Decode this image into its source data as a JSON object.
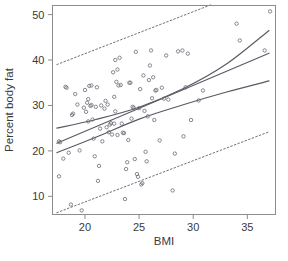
{
  "figure": {
    "background_color": "#ffffff",
    "frame_color": "#8c8c8c",
    "point_color": "#6b6b76",
    "line_color": "#595964",
    "band_color": "#6f6f7a"
  },
  "chart_data": {
    "type": "scatter",
    "title": "",
    "subtitle": "",
    "xlabel": "BMI",
    "ylabel": "Percent body fat",
    "xlim": [
      17.0,
      37.6
    ],
    "ylim": [
      6.0,
      52.0
    ],
    "grid": false,
    "legend_position": "none",
    "xticks": [
      20,
      25,
      30,
      35
    ],
    "xticklabels": [
      "20",
      "25",
      "30",
      "35"
    ],
    "yticks": [
      10,
      20,
      30,
      40,
      50
    ],
    "yticklabels": [
      "10",
      "20",
      "30",
      "40",
      "50"
    ],
    "marker": "open-circle",
    "annotations": [],
    "points": [
      {
        "x": 17.6,
        "y": 14.4
      },
      {
        "x": 17.6,
        "y": 22.1
      },
      {
        "x": 17.7,
        "y": 21.9
      },
      {
        "x": 18.0,
        "y": 18.3
      },
      {
        "x": 18.2,
        "y": 34.1
      },
      {
        "x": 18.3,
        "y": 33.9
      },
      {
        "x": 18.5,
        "y": 19.6
      },
      {
        "x": 18.7,
        "y": 8.2
      },
      {
        "x": 18.8,
        "y": 27.9
      },
      {
        "x": 18.9,
        "y": 28.2
      },
      {
        "x": 19.1,
        "y": 32.5
      },
      {
        "x": 19.3,
        "y": 30.2
      },
      {
        "x": 19.5,
        "y": 20.1
      },
      {
        "x": 19.7,
        "y": 6.9
      },
      {
        "x": 19.9,
        "y": 29.5
      },
      {
        "x": 20.0,
        "y": 33.4
      },
      {
        "x": 20.1,
        "y": 28.6
      },
      {
        "x": 20.2,
        "y": 30.6
      },
      {
        "x": 20.3,
        "y": 31.4
      },
      {
        "x": 20.3,
        "y": 26.5
      },
      {
        "x": 20.4,
        "y": 34.3
      },
      {
        "x": 20.5,
        "y": 29.9
      },
      {
        "x": 20.6,
        "y": 30.1
      },
      {
        "x": 20.6,
        "y": 34.4
      },
      {
        "x": 20.7,
        "y": 26.9
      },
      {
        "x": 20.8,
        "y": 22.7
      },
      {
        "x": 20.9,
        "y": 18.8
      },
      {
        "x": 21.0,
        "y": 29.7
      },
      {
        "x": 21.1,
        "y": 34.0
      },
      {
        "x": 21.2,
        "y": 13.4
      },
      {
        "x": 21.3,
        "y": 16.7
      },
      {
        "x": 21.4,
        "y": 24.9
      },
      {
        "x": 21.5,
        "y": 30.0
      },
      {
        "x": 21.6,
        "y": 22.1
      },
      {
        "x": 21.8,
        "y": 29.3
      },
      {
        "x": 21.9,
        "y": 31.0
      },
      {
        "x": 22.0,
        "y": 25.2
      },
      {
        "x": 22.1,
        "y": 30.2
      },
      {
        "x": 22.2,
        "y": 24.1
      },
      {
        "x": 22.3,
        "y": 25.8
      },
      {
        "x": 22.4,
        "y": 26.1
      },
      {
        "x": 22.5,
        "y": 23.6
      },
      {
        "x": 22.6,
        "y": 37.3
      },
      {
        "x": 22.7,
        "y": 26.0
      },
      {
        "x": 22.7,
        "y": 31.9
      },
      {
        "x": 22.8,
        "y": 28.7
      },
      {
        "x": 22.8,
        "y": 40.0
      },
      {
        "x": 22.9,
        "y": 35.2
      },
      {
        "x": 23.0,
        "y": 37.9
      },
      {
        "x": 23.0,
        "y": 23.5
      },
      {
        "x": 23.1,
        "y": 34.4
      },
      {
        "x": 23.2,
        "y": 40.5
      },
      {
        "x": 23.3,
        "y": 34.5
      },
      {
        "x": 23.4,
        "y": 26.0
      },
      {
        "x": 23.5,
        "y": 24.0
      },
      {
        "x": 23.6,
        "y": 23.9
      },
      {
        "x": 23.7,
        "y": 9.4
      },
      {
        "x": 23.8,
        "y": 16.0
      },
      {
        "x": 23.9,
        "y": 17.5
      },
      {
        "x": 24.0,
        "y": 22.4
      },
      {
        "x": 24.1,
        "y": 35.0
      },
      {
        "x": 24.2,
        "y": 35.0
      },
      {
        "x": 24.3,
        "y": 27.1
      },
      {
        "x": 24.4,
        "y": 29.7
      },
      {
        "x": 24.5,
        "y": 29.5
      },
      {
        "x": 24.6,
        "y": 18.2
      },
      {
        "x": 24.7,
        "y": 41.8
      },
      {
        "x": 24.8,
        "y": 14.9
      },
      {
        "x": 24.9,
        "y": 14.3
      },
      {
        "x": 25.0,
        "y": 29.4
      },
      {
        "x": 25.1,
        "y": 33.6
      },
      {
        "x": 25.2,
        "y": 12.6
      },
      {
        "x": 25.3,
        "y": 12.9
      },
      {
        "x": 25.4,
        "y": 36.6
      },
      {
        "x": 25.5,
        "y": 28.8
      },
      {
        "x": 25.6,
        "y": 19.8
      },
      {
        "x": 25.7,
        "y": 17.7
      },
      {
        "x": 25.8,
        "y": 27.6
      },
      {
        "x": 25.9,
        "y": 35.6
      },
      {
        "x": 26.0,
        "y": 38.8
      },
      {
        "x": 26.1,
        "y": 42.1
      },
      {
        "x": 26.2,
        "y": 31.6
      },
      {
        "x": 26.3,
        "y": 36.2
      },
      {
        "x": 26.4,
        "y": 26.8
      },
      {
        "x": 26.5,
        "y": 33.3
      },
      {
        "x": 26.6,
        "y": 33.4
      },
      {
        "x": 26.9,
        "y": 22.3
      },
      {
        "x": 27.1,
        "y": 33.9
      },
      {
        "x": 27.3,
        "y": 31.5
      },
      {
        "x": 27.5,
        "y": 41.0
      },
      {
        "x": 27.7,
        "y": 31.3
      },
      {
        "x": 28.1,
        "y": 11.3
      },
      {
        "x": 28.3,
        "y": 19.4
      },
      {
        "x": 28.6,
        "y": 41.9
      },
      {
        "x": 29.0,
        "y": 42.1
      },
      {
        "x": 29.1,
        "y": 23.2
      },
      {
        "x": 29.3,
        "y": 34.0
      },
      {
        "x": 29.5,
        "y": 41.4
      },
      {
        "x": 29.8,
        "y": 26.8
      },
      {
        "x": 30.5,
        "y": 31.1
      },
      {
        "x": 30.9,
        "y": 33.3
      },
      {
        "x": 34.0,
        "y": 48.0
      },
      {
        "x": 34.3,
        "y": 44.3
      },
      {
        "x": 36.6,
        "y": 42.1
      },
      {
        "x": 37.1,
        "y": 50.7
      }
    ],
    "series": [
      {
        "name": "regression-fit",
        "style": "solid",
        "x": [
          17.4,
          37.0
        ],
        "y": [
          21.7,
          41.5
        ]
      },
      {
        "name": "confidence-band-upper",
        "style": "solid",
        "x": [
          17.4,
          21.0,
          25.0,
          29.0,
          33.0,
          37.0
        ],
        "y": [
          25.0,
          26.9,
          29.6,
          33.6,
          39.0,
          46.5
        ]
      },
      {
        "name": "confidence-band-lower",
        "style": "solid",
        "x": [
          17.4,
          21.0,
          25.0,
          29.0,
          33.0,
          37.0
        ],
        "y": [
          19.6,
          23.0,
          27.0,
          30.1,
          32.9,
          35.4
        ]
      },
      {
        "name": "prediction-band-upper",
        "style": "dashed",
        "x": [
          17.4,
          31.8
        ],
        "y": [
          39.0,
          52.3
        ]
      },
      {
        "name": "prediction-band-lower",
        "style": "dashed",
        "x": [
          17.4,
          37.0
        ],
        "y": [
          6.4,
          24.2
        ]
      }
    ]
  }
}
